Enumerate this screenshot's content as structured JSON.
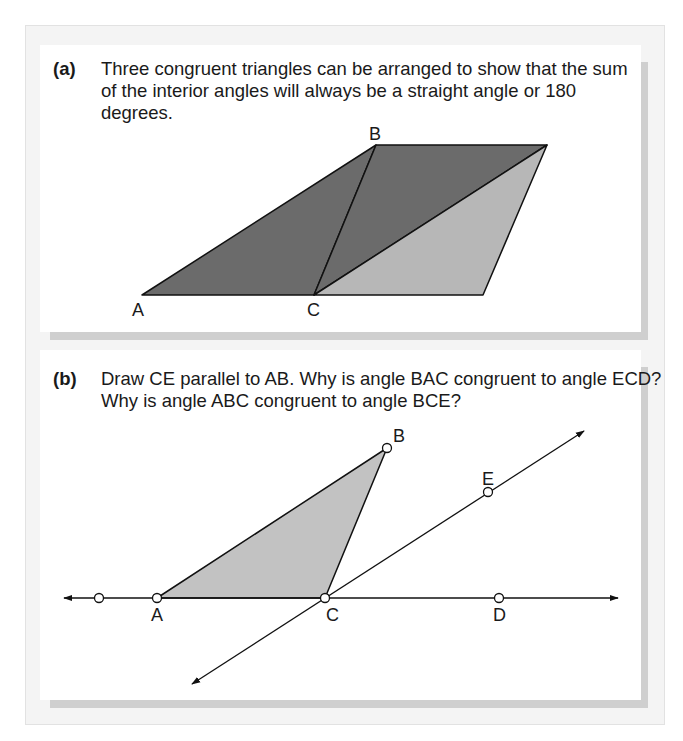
{
  "panel_a": {
    "tag": "(a)",
    "caption": "Three congruent triangles can be arranged to show that the sum of the interior angles will always be a straight angle or 180 degrees.",
    "labels": {
      "A": "A",
      "B": "B",
      "C": "C"
    },
    "colors": {
      "dark": "#6b6b6b",
      "light": "#b7b7b7",
      "stroke": "#111111"
    }
  },
  "panel_b": {
    "tag": "(b)",
    "caption": "Draw CE parallel to AB. Why is angle BAC congruent to angle ECD? Why is angle ABC congruent to angle BCE?",
    "labels": {
      "A": "A",
      "B": "B",
      "C": "C",
      "D": "D",
      "E": "E"
    },
    "colors": {
      "triangle": "#c2c2c2",
      "stroke": "#111111"
    }
  }
}
